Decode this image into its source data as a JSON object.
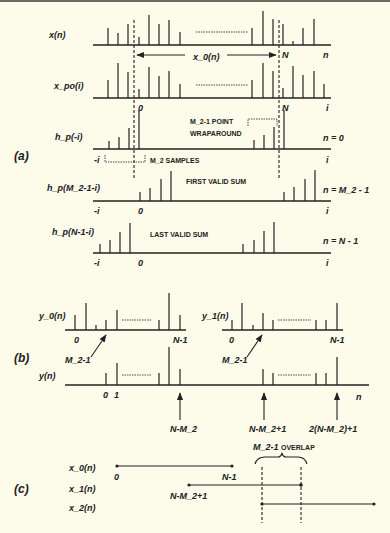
{
  "figure": {
    "background": "#fdfbea",
    "ink": "#222222",
    "section_a": {
      "tag": "(a)",
      "rows": [
        {
          "label": "x(n)",
          "axis_end": "n",
          "marker_N": "N"
        },
        {
          "label": "x_po(i)",
          "axis_end": "i",
          "tick_0": "0",
          "marker_N": "N"
        },
        {
          "label": "h_p(-i)",
          "axis_start": "-i",
          "axis_end": "i",
          "condition": "n = 0"
        },
        {
          "label": "h_p(M_2-1-i)",
          "axis_start": "-i",
          "axis_end": "i",
          "tick_0": "0",
          "condition": "n = M_2 - 1"
        },
        {
          "label": "h_p(N-1-i)",
          "axis_start": "-i",
          "axis_end": "i",
          "tick_0": "0",
          "condition": "n = N - 1"
        }
      ],
      "range_label": "x_0(n)",
      "wraparound_label_1": "M_2-1  POINT",
      "wraparound_label_2": "WRAPAROUND",
      "samples_label": "M_2   SAMPLES",
      "first_valid": "FIRST VALID SUM",
      "last_valid": "LAST VALID SUM"
    },
    "section_b": {
      "tag": "(b)",
      "y0_label": "y_0(n)",
      "y1_label": "y_1(n)",
      "y_label": "y(n)",
      "tick_0": "0",
      "tick_1": "1",
      "tick_N1": "N-1",
      "arrow_label": "M_2-1",
      "axis_end": "n",
      "marks": [
        "N-M_2",
        "N-M_2+1",
        "2(N-M_2)+1"
      ]
    },
    "section_c": {
      "tag": "(c)",
      "rows": [
        "x_0(n)",
        "x_1(n)",
        "x_2(n)"
      ],
      "start_0": "0",
      "end_0": "N-1",
      "start_1": "N-M_2+1",
      "overlap_num": "M_2-1",
      "overlap_text": "OVERLAP"
    }
  }
}
